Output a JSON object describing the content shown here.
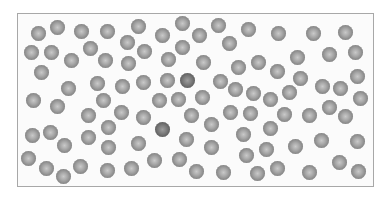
{
  "diagram": {
    "type": "particle-container",
    "container": {
      "x": 17,
      "y": 13,
      "width": 357,
      "height": 174,
      "border_color": "#a8a8a8",
      "fill": "#fbfbfb"
    },
    "particle": {
      "diameter": 15,
      "color": "#a9a9a9",
      "dark_color": "#7c7c7c"
    },
    "particles": [
      [
        38,
        33
      ],
      [
        57,
        27
      ],
      [
        81,
        31
      ],
      [
        107,
        31
      ],
      [
        138,
        26
      ],
      [
        162,
        35
      ],
      [
        182,
        23
      ],
      [
        31,
        52
      ],
      [
        51,
        52
      ],
      [
        71,
        60
      ],
      [
        90,
        48
      ],
      [
        105,
        60
      ],
      [
        127,
        42
      ],
      [
        128,
        63
      ],
      [
        144,
        51
      ],
      [
        168,
        59
      ],
      [
        182,
        47
      ],
      [
        41,
        72
      ],
      [
        68,
        88
      ],
      [
        97,
        83
      ],
      [
        122,
        86
      ],
      [
        143,
        82
      ],
      [
        167,
        80
      ],
      [
        187,
        80,
        "dark"
      ],
      [
        33,
        100
      ],
      [
        57,
        106
      ],
      [
        103,
        100
      ],
      [
        159,
        100
      ],
      [
        178,
        99
      ],
      [
        199,
        35
      ],
      [
        218,
        25
      ],
      [
        248,
        29
      ],
      [
        278,
        33
      ],
      [
        313,
        33
      ],
      [
        345,
        32
      ],
      [
        229,
        43
      ],
      [
        203,
        62
      ],
      [
        238,
        67
      ],
      [
        258,
        62
      ],
      [
        277,
        71
      ],
      [
        297,
        57
      ],
      [
        329,
        54
      ],
      [
        355,
        52
      ],
      [
        220,
        81
      ],
      [
        235,
        89
      ],
      [
        253,
        93
      ],
      [
        270,
        99
      ],
      [
        289,
        92
      ],
      [
        300,
        78
      ],
      [
        322,
        86
      ],
      [
        340,
        88
      ],
      [
        357,
        76
      ],
      [
        202,
        97
      ],
      [
        360,
        98
      ],
      [
        88,
        115
      ],
      [
        121,
        112
      ],
      [
        143,
        117
      ],
      [
        191,
        115
      ],
      [
        32,
        135
      ],
      [
        50,
        132
      ],
      [
        64,
        145
      ],
      [
        88,
        137
      ],
      [
        108,
        127
      ],
      [
        108,
        147
      ],
      [
        138,
        143
      ],
      [
        162,
        129,
        "dark"
      ],
      [
        186,
        139
      ],
      [
        28,
        158
      ],
      [
        46,
        168
      ],
      [
        63,
        176
      ],
      [
        80,
        166
      ],
      [
        107,
        170
      ],
      [
        131,
        168
      ],
      [
        154,
        160
      ],
      [
        179,
        159
      ],
      [
        196,
        171
      ],
      [
        230,
        112
      ],
      [
        250,
        113
      ],
      [
        284,
        114
      ],
      [
        309,
        115
      ],
      [
        329,
        107
      ],
      [
        345,
        116
      ],
      [
        211,
        124
      ],
      [
        243,
        134
      ],
      [
        270,
        128
      ],
      [
        211,
        147
      ],
      [
        246,
        155
      ],
      [
        266,
        149
      ],
      [
        295,
        146
      ],
      [
        321,
        140
      ],
      [
        357,
        141
      ],
      [
        223,
        172
      ],
      [
        257,
        173
      ],
      [
        277,
        168
      ],
      [
        309,
        172
      ],
      [
        339,
        162
      ],
      [
        358,
        171
      ]
    ]
  }
}
